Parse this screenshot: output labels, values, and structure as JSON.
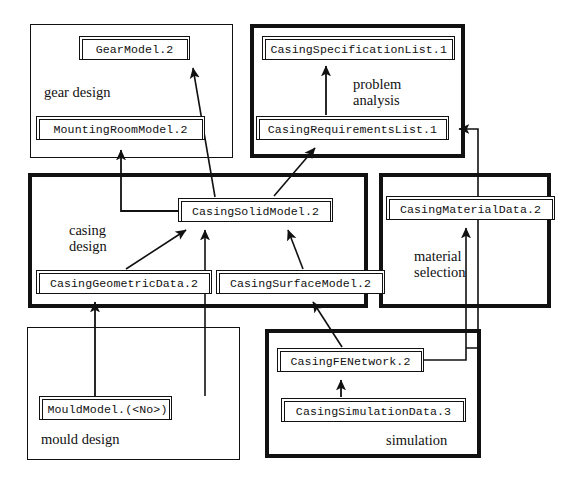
{
  "diagram": {
    "background": "#ffffff",
    "line_color": "#111111"
  },
  "groups": [
    {
      "id": "gear-design",
      "label": "gear design",
      "frame": "thin",
      "x": 30,
      "y": 24,
      "w": 203,
      "h": 134,
      "label_x": 44,
      "label_y": 84
    },
    {
      "id": "problem-analysis",
      "label": "problem\nanalysis",
      "frame": "thick",
      "x": 250,
      "y": 24,
      "w": 215,
      "h": 134,
      "label_x": 353,
      "label_y": 76
    },
    {
      "id": "casing-design",
      "label": "casing\ndesign",
      "frame": "thick",
      "x": 28,
      "y": 173,
      "w": 340,
      "h": 135,
      "label_x": 69,
      "label_y": 222
    },
    {
      "id": "material-selection",
      "label": "material\nselection",
      "frame": "thick",
      "x": 379,
      "y": 173,
      "w": 172,
      "h": 135,
      "label_x": 414,
      "label_y": 248
    },
    {
      "id": "mould-design",
      "label": "mould design",
      "frame": "thin",
      "x": 27,
      "y": 327,
      "w": 213,
      "h": 133,
      "label_x": 41,
      "label_y": 431
    },
    {
      "id": "simulation",
      "label": "simulation",
      "frame": "thick",
      "x": 265,
      "y": 329,
      "w": 216,
      "h": 129,
      "label_x": 386,
      "label_y": 432
    }
  ],
  "nodes": [
    {
      "id": "gear-model",
      "label": "GearModel.2",
      "x": 79,
      "y": 36,
      "w": 111,
      "h": 24
    },
    {
      "id": "mounting-room-model",
      "label": "MountingRoomModel.2",
      "x": 36,
      "y": 116,
      "w": 169,
      "h": 24
    },
    {
      "id": "casing-specification-list",
      "label": "CasingSpecificationList.1",
      "x": 262,
      "y": 36,
      "w": 193,
      "h": 24
    },
    {
      "id": "casing-requirements-list",
      "label": "CasingRequirementsList.1",
      "x": 256,
      "y": 116,
      "w": 193,
      "h": 24
    },
    {
      "id": "casing-solid-model",
      "label": "CasingSolidModel.2",
      "x": 178,
      "y": 198,
      "w": 155,
      "h": 24
    },
    {
      "id": "casing-geometric-data",
      "label": "CasingGeometricData.2",
      "x": 36,
      "y": 270,
      "w": 176,
      "h": 24
    },
    {
      "id": "casing-surface-model",
      "label": "CasingSurfaceModel.2",
      "x": 216,
      "y": 270,
      "w": 169,
      "h": 24
    },
    {
      "id": "casing-material-data",
      "label": "CasingMaterialData.2",
      "x": 386,
      "y": 196,
      "w": 169,
      "h": 24
    },
    {
      "id": "casing-fe-network",
      "label": "CasingFENetwork.2",
      "x": 277,
      "y": 348,
      "w": 147,
      "h": 24
    },
    {
      "id": "casing-simulation-data",
      "label": "CasingSimulationData.3",
      "x": 281,
      "y": 398,
      "w": 185,
      "h": 24
    },
    {
      "id": "mould-model",
      "label": "MouldModel.(<No>)",
      "x": 39,
      "y": 396,
      "w": 133,
      "h": 24
    }
  ],
  "edges": [
    {
      "id": "requirements-to-specification",
      "from": "casing-requirements-list",
      "to": "casing-specification-list",
      "style": "straight-vertical"
    },
    {
      "id": "solidmodel-to-gearmodel",
      "from": "casing-solid-model",
      "to": "gear-model",
      "style": "diagonal"
    },
    {
      "id": "solidmodel-to-requirements",
      "from": "casing-solid-model",
      "to": "casing-requirements-list",
      "style": "diagonal"
    },
    {
      "id": "solidmodel-to-mountingroom",
      "from": "casing-solid-model",
      "to": "mounting-room-model",
      "style": "orthogonal"
    },
    {
      "id": "geometricdata-to-solidmodel",
      "from": "casing-geometric-data",
      "to": "casing-solid-model",
      "style": "diagonal"
    },
    {
      "id": "surfacemodel-to-solidmodel",
      "from": "casing-surface-model",
      "to": "casing-solid-model",
      "style": "diagonal"
    },
    {
      "id": "mouldmodel-to-solidmodel",
      "from": "mould-model",
      "to": "casing-solid-model",
      "style": "straight-vertical"
    },
    {
      "id": "mouldmodel-to-geometricdata",
      "from": "mould-model",
      "to": "casing-geometric-data",
      "style": "straight-vertical"
    },
    {
      "id": "fenetwork-to-surfacemodel",
      "from": "casing-fe-network",
      "to": "casing-surface-model",
      "style": "diagonal"
    },
    {
      "id": "simulationdata-to-fenetwork",
      "from": "casing-simulation-data",
      "to": "casing-fe-network",
      "style": "straight-vertical"
    },
    {
      "id": "fenetwork-to-materialdata",
      "from": "casing-fe-network",
      "to": "casing-material-data",
      "style": "orthogonal"
    },
    {
      "id": "materialdata-to-requirements",
      "from": "casing-material-data",
      "to": "casing-requirements-list",
      "style": "orthogonal"
    }
  ]
}
